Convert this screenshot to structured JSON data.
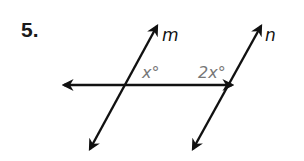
{
  "problem": {
    "number": "5."
  },
  "diagram": {
    "lines": [
      {
        "name": "m",
        "label": "m"
      },
      {
        "name": "n",
        "label": "n"
      },
      {
        "name": "transversal",
        "label": ""
      }
    ],
    "angles": [
      {
        "name": "angle-m",
        "label": "x°"
      },
      {
        "name": "angle-n",
        "label": "2x°"
      }
    ],
    "colors": {
      "line": "#111111",
      "angle_label": "#777777"
    }
  }
}
